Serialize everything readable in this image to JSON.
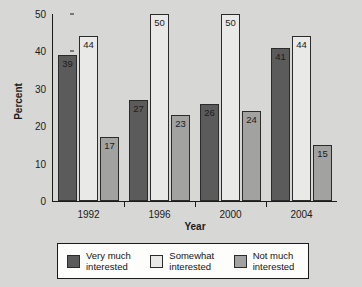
{
  "chart_data": {
    "type": "bar",
    "title": "",
    "xlabel": "Year",
    "ylabel": "Percent",
    "categories": [
      "1992",
      "1996",
      "2000",
      "2004"
    ],
    "series": [
      {
        "name": "Very much\ninterested",
        "color": "#5b5b5b",
        "values": [
          39,
          27,
          26,
          41
        ]
      },
      {
        "name": "Somewhat\ninterested",
        "color": "#e9e9e7",
        "values": [
          44,
          50,
          50,
          44
        ]
      },
      {
        "name": "Not much\ninterested",
        "color": "#a2a2a0",
        "values": [
          17,
          23,
          24,
          15
        ]
      }
    ],
    "ylim": [
      0,
      50
    ],
    "yticks": [
      0,
      10,
      20,
      30,
      40,
      50
    ],
    "ytick_labels": [
      "0",
      "10",
      "20",
      "30",
      "40",
      "50"
    ],
    "grid": false,
    "legend_position": "bottom"
  },
  "axes": {
    "y_title": "Percent",
    "x_title": "Year"
  },
  "colors": {
    "background": "#d7d7d5",
    "axis": "#1b1b1b",
    "bar_outline": "#2b2b2b",
    "legend_background": "#fdfdfb",
    "very_much": "#5b5b5b",
    "somewhat": "#e9e9e7",
    "not_much": "#a2a2a0"
  }
}
